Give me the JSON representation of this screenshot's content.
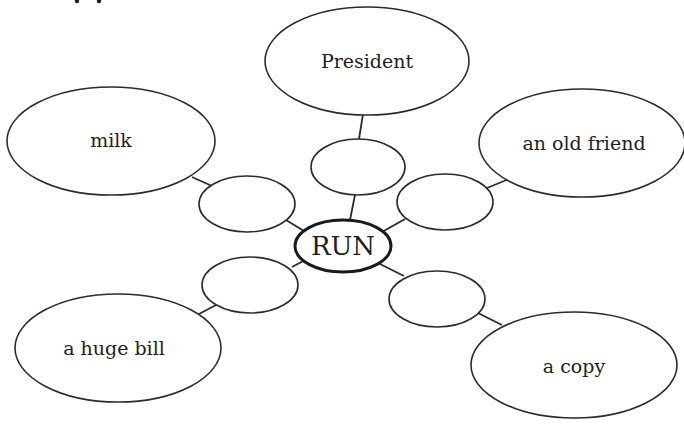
{
  "diagram": {
    "type": "word-web",
    "top_fragment": "",
    "center": {
      "label": "RUN",
      "cx": 343,
      "cy": 246,
      "rx": 48,
      "ry": 26
    },
    "branches": [
      {
        "id": "president",
        "outer": {
          "label": "President",
          "cx": 367,
          "cy": 61,
          "rx": 102,
          "ry": 54
        },
        "mid": {
          "label": "",
          "cx": 358,
          "cy": 167,
          "rx": 47,
          "ry": 28
        },
        "lines": [
          [
            363,
            114,
            359,
            139
          ],
          [
            355,
            195,
            350,
            220
          ]
        ]
      },
      {
        "id": "milk",
        "outer": {
          "label": "milk",
          "cx": 111,
          "cy": 141,
          "rx": 104,
          "ry": 54
        },
        "mid": {
          "label": "",
          "cx": 247,
          "cy": 204,
          "rx": 48,
          "ry": 28
        },
        "lines": [
          [
            192,
            177,
            212,
            186
          ],
          [
            286,
            220,
            304,
            231
          ]
        ]
      },
      {
        "id": "old-friend",
        "outer": {
          "label": "an old friend",
          "cx": 582,
          "cy": 143,
          "rx": 103,
          "ry": 54
        },
        "mid": {
          "label": "",
          "cx": 445,
          "cy": 202,
          "rx": 48,
          "ry": 28
        },
        "lines": [
          [
            509,
            179,
            487,
            188
          ],
          [
            405,
            219,
            382,
            232
          ]
        ]
      },
      {
        "id": "huge-bill",
        "outer": {
          "label": "a huge bill",
          "cx": 118,
          "cy": 348,
          "rx": 103,
          "ry": 54
        },
        "mid": {
          "label": "",
          "cx": 250,
          "cy": 285,
          "rx": 48,
          "ry": 28
        },
        "lines": [
          [
            199,
            314,
            216,
            305
          ],
          [
            292,
            267,
            307,
            259
          ]
        ]
      },
      {
        "id": "copy",
        "outer": {
          "label": "a copy",
          "cx": 574,
          "cy": 365,
          "rx": 103,
          "ry": 53
        },
        "mid": {
          "label": "",
          "cx": 437,
          "cy": 299,
          "rx": 48,
          "ry": 28
        },
        "lines": [
          [
            378,
            263,
            404,
            276
          ],
          [
            478,
            313,
            502,
            325
          ]
        ]
      }
    ]
  }
}
